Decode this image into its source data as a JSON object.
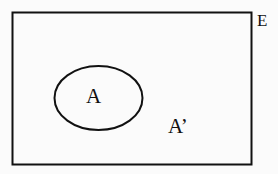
{
  "diagram": {
    "type": "venn",
    "universal_set": {
      "label": "E",
      "shape": "rectangle"
    },
    "sets": [
      {
        "label": "A",
        "shape": "ellipse"
      }
    ],
    "complement": {
      "label": "A’"
    },
    "colors": {
      "stroke": "#111111",
      "background": "#fbfbfb"
    }
  }
}
